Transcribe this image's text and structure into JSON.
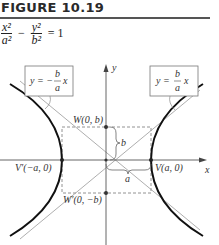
{
  "figure": {
    "title": "FIGURE 10.19",
    "equation": {
      "term1_num": "x²",
      "term1_den": "a²",
      "operator": "−",
      "term2_num": "y²",
      "term2_den": "b²",
      "rhs": "= 1"
    }
  },
  "diagram": {
    "axes": {
      "x_label": "x",
      "y_label": "y"
    },
    "points": {
      "vertex_right": "V(a, 0)",
      "vertex_left": "V′(−a, 0)",
      "covertex_top": "W(0, b)",
      "covertex_bottom": "W′(0, −b)"
    },
    "braces": {
      "vertical": "b",
      "horizontal": "a"
    },
    "asymptotes": {
      "negative": {
        "lhs": "y = −",
        "frac_num": "b",
        "frac_den": "a",
        "rhs": "x"
      },
      "positive": {
        "lhs": "y =",
        "frac_num": "b",
        "frac_den": "a",
        "rhs": "x"
      }
    },
    "colors": {
      "curve": "#111111",
      "axis": "#555555",
      "guide": "#888888"
    }
  }
}
